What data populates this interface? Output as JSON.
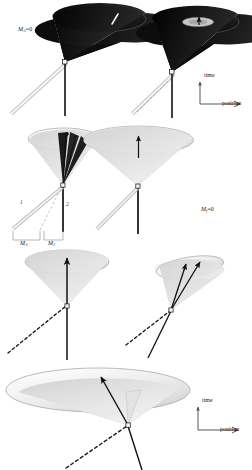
{
  "figure": {
    "background": "#ffffff",
    "width": 252,
    "height": 470,
    "colors": {
      "cone_dark": "#1a1a1a",
      "cone_dark_mid": "#2e2e2e",
      "cone_light": "#cfcfcf",
      "cone_light_top": "#e8e8e8",
      "rim": "#8a8a8a",
      "line": "#111111",
      "dashed": "#222222",
      "worldline_open": "#bdbdbd",
      "axis": "#444444"
    }
  },
  "panels": [
    {
      "id": "panel-top-left",
      "name": "massless-dark-cone",
      "label": {
        "symbol": "M",
        "subscript": "A",
        "equals": "=",
        "value": "0",
        "text": "M_A=0"
      },
      "cone": {
        "shade": "dark",
        "tilt": "upright",
        "aperture": "wide"
      },
      "features": [
        "white-streak-on-rim",
        "vertical-worldline",
        "open-null-ray"
      ]
    },
    {
      "id": "panel-top-right",
      "name": "dark-cone-with-inner-ellipse",
      "cone": {
        "shade": "dark",
        "tilt": "upright",
        "aperture": "wide"
      },
      "features": [
        "inner-light-ellipse",
        "apex-dot-arrow",
        "vertical-worldline",
        "dashed-null-ray"
      ]
    },
    {
      "id": "panel-mid-left",
      "name": "cone-with-dark-wedges",
      "cone": {
        "shade": "light",
        "tilt": "upright",
        "aperture": "medium"
      },
      "features": [
        "dark-wedge-fan",
        "vertical-worldline",
        "dashed-ray",
        "open-ray"
      ],
      "ray_labels": [
        {
          "id": "ray-1",
          "text": "1"
        },
        {
          "id": "ray-2",
          "text": "2"
        }
      ],
      "brackets": [
        {
          "id": "bracket-left",
          "symbol": "M",
          "subscript": "A",
          "text": "M_A"
        },
        {
          "id": "bracket-right",
          "symbol": "M",
          "subscript": "1",
          "text": "M_1"
        }
      ]
    },
    {
      "id": "panel-mid-right",
      "name": "wide-light-cone",
      "label": {
        "symbol": "M",
        "subscript": "f",
        "equals": "=",
        "value": "0",
        "text": "M_f=0"
      },
      "cone": {
        "shade": "light",
        "tilt": "upright",
        "aperture": "wide"
      },
      "features": [
        "central-up-arrow",
        "vertical-worldline",
        "open-null-ray"
      ]
    },
    {
      "id": "panel-low-left",
      "name": "upright-cone-vertical-arrow",
      "cone": {
        "shade": "light",
        "tilt": "upright",
        "aperture": "medium"
      },
      "features": [
        "vertical-arrow",
        "dashed-diagonal-ray"
      ]
    },
    {
      "id": "panel-low-right",
      "name": "tilted-cone-arrows",
      "cone": {
        "shade": "light",
        "tilt": "tilted-right",
        "aperture": "narrow"
      },
      "features": [
        "two-arrows",
        "dashed-diagonal-ray",
        "solid-diagonal-ray"
      ]
    },
    {
      "id": "panel-bottom",
      "name": "flattened-wide-cone",
      "cone": {
        "shade": "light",
        "tilt": "flattened",
        "aperture": "very-wide"
      },
      "features": [
        "long-arrow",
        "dashed-diagonal-ray",
        "solid-diagonal-ray"
      ]
    }
  ],
  "axes": [
    {
      "id": "axes-top-right",
      "time_label": "time",
      "position_label": "position"
    },
    {
      "id": "axes-bottom-right",
      "time_label": "time",
      "position_label": "position"
    }
  ]
}
